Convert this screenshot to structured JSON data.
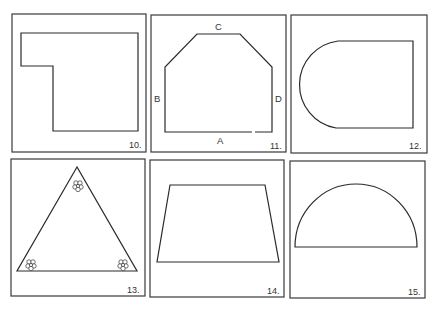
{
  "figures": [
    {
      "number": "10.",
      "shape": "L-shaped polygon"
    },
    {
      "number": "11.",
      "shape": "irregular hexagon",
      "vertex_labels": {
        "top": "C",
        "left": "B",
        "right": "D",
        "bottom": "A"
      }
    },
    {
      "number": "12.",
      "shape": "rectangle with semicircular left end"
    },
    {
      "number": "13.",
      "shape": "triangle with flower clusters at vertices"
    },
    {
      "number": "14.",
      "shape": "trapezoid"
    },
    {
      "number": "15.",
      "shape": "semicircle"
    }
  ],
  "colors": {
    "line": "#2a2a2a",
    "frame": "#3a3a3a",
    "background": "#ffffff"
  }
}
